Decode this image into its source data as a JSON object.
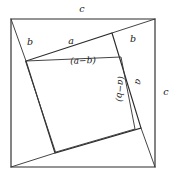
{
  "figure": {
    "stroke_color": "#2b2b2b",
    "inner_stroke_color": "#3a3a3a",
    "background_color": "#ffffff",
    "text_color": "#1a1a1a",
    "outer_square": {
      "name": "outer-square",
      "points": "11,19 155,19 155,167 11,167",
      "side_label": "c"
    },
    "tilted_square": {
      "name": "tilted-square",
      "points": "112,33 141,128 55,153 26,61"
    },
    "inner_square": {
      "name": "inner-square",
      "points": "26,61 121,57 135,129 56,152"
    },
    "segments": [
      {
        "name": "segment-top-left-to-vertex",
        "x1": 11,
        "y1": 19,
        "x2": 26,
        "y2": 61
      },
      {
        "name": "segment-top-right-to-vertex",
        "x1": 155,
        "y1": 19,
        "x2": 112,
        "y2": 33
      },
      {
        "name": "segment-bottom-right-to-vertex",
        "x1": 155,
        "y1": 167,
        "x2": 141,
        "y2": 128
      },
      {
        "name": "segment-bottom-left-to-vertex",
        "x1": 11,
        "y1": 167,
        "x2": 55,
        "y2": 153
      }
    ],
    "labels": [
      {
        "id": "label-c-top",
        "name": "label-c-top",
        "text": "c",
        "x": 82,
        "y": 9,
        "rotate": 0,
        "size": "sz-mid"
      },
      {
        "id": "label-c-right",
        "name": "label-c-right",
        "text": "c",
        "x": 166,
        "y": 92,
        "rotate": 0,
        "size": "sz-mid"
      },
      {
        "id": "label-b-left",
        "name": "label-b-left",
        "text": "b",
        "x": 30,
        "y": 42,
        "rotate": 0,
        "size": "sz-mid"
      },
      {
        "id": "label-a-top",
        "name": "label-a-top",
        "text": "a",
        "x": 71,
        "y": 41,
        "rotate": 0,
        "size": "sz-mid"
      },
      {
        "id": "label-b-right",
        "name": "label-b-right",
        "text": "b",
        "x": 133,
        "y": 39,
        "rotate": 0,
        "size": "sz-mid"
      },
      {
        "id": "label-amb-top",
        "name": "label-a-minus-b-top",
        "text": "(a−b)",
        "x": 83,
        "y": 61,
        "rotate": -2,
        "size": "sz-paren"
      },
      {
        "id": "label-amb-right",
        "name": "label-a-minus-b-right",
        "text": "(a−b)",
        "x": 120,
        "y": 89,
        "rotate": 95,
        "size": "sz-paren"
      },
      {
        "id": "label-a-right",
        "name": "label-a-right",
        "text": "a",
        "x": 138,
        "y": 82,
        "rotate": 105,
        "size": "sz-mid"
      }
    ]
  }
}
